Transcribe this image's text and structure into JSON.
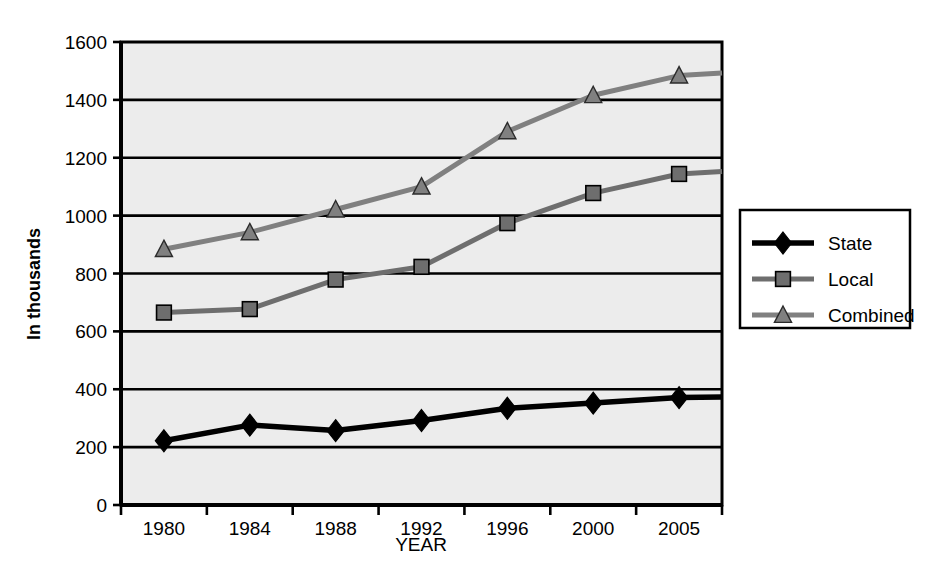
{
  "chart_data": {
    "type": "line",
    "title": "",
    "xlabel": "YEAR",
    "ylabel": "In thousands",
    "categories": [
      "1980",
      "1984",
      "1988",
      "1992",
      "1996",
      "2000",
      "2005"
    ],
    "ylim": [
      0,
      1600
    ],
    "y_ticks": [
      0,
      200,
      400,
      600,
      800,
      1000,
      1200,
      1400,
      1600
    ],
    "grid": true,
    "legend_position": "right",
    "series": [
      {
        "name": "State",
        "marker": "diamond",
        "color": "#000000",
        "values": [
          222,
          276,
          257,
          292,
          334,
          352,
          371
        ]
      },
      {
        "name": "Local",
        "marker": "square",
        "color": "#6e6e6e",
        "values": [
          665,
          677,
          779,
          823,
          974,
          1078,
          1144
        ]
      },
      {
        "name": "Combined",
        "marker": "triangle",
        "color": "#808080",
        "values": [
          884,
          942,
          1021,
          1100,
          1291,
          1416,
          1484
        ]
      }
    ]
  },
  "axes": {
    "y_tick_labels": [
      "1600",
      "1400",
      "1200",
      "1000",
      "800",
      "600",
      "400",
      "200",
      "0"
    ],
    "x_tick_labels": [
      "1980",
      "1984",
      "1988",
      "1992",
      "1996",
      "2000",
      "2005"
    ],
    "y_axis_title": "In thousands",
    "x_axis_title": "YEAR"
  },
  "legend": {
    "items": [
      {
        "label": "State",
        "marker": "diamond-marker",
        "color": "#000000"
      },
      {
        "label": "Local",
        "marker": "square-marker",
        "color": "#6e6e6e"
      },
      {
        "label": "Combined",
        "marker": "triangle-marker",
        "color": "#808080"
      }
    ]
  },
  "colors": {
    "plot_background": "#ececec",
    "page_background": "#ffffff",
    "axis": "#000000",
    "gridline": "#000000",
    "state": "#000000",
    "local": "#6e6e6e",
    "combined": "#808080"
  }
}
